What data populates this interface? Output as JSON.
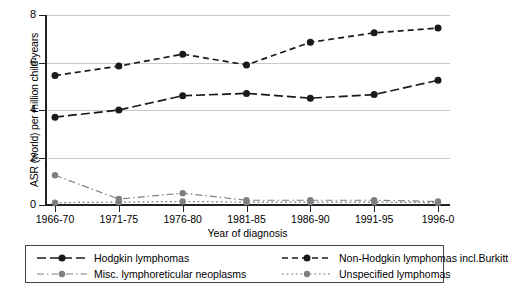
{
  "chart_data": {
    "type": "line",
    "title": "",
    "xlabel": "Year of diagnosis",
    "ylabel": "ASR (world) per million child-years",
    "categories": [
      "1966-70",
      "1971-75",
      "1976-80",
      "1981-85",
      "1986-90",
      "1991-95",
      "1996-0"
    ],
    "ylim": [
      0,
      8
    ],
    "yticks": [
      "0",
      "2",
      "4",
      "6",
      "8"
    ],
    "grid": "horizontal",
    "legend_position": "bottom",
    "series": [
      {
        "name": "Hodgkin lymphomas",
        "values": [
          3.7,
          4.0,
          4.6,
          4.7,
          4.5,
          4.65,
          5.25
        ],
        "color": "#1a1a1a",
        "dash": "long-dash",
        "marker": "circle"
      },
      {
        "name": "Non-Hodgkin lymphomas incl.Burkitt",
        "values": [
          5.45,
          5.85,
          6.35,
          5.9,
          6.85,
          7.25,
          7.45
        ],
        "color": "#1a1a1a",
        "dash": "dash",
        "marker": "circle"
      },
      {
        "name": "Misc. lymphoreticular neoplasms",
        "values": [
          1.25,
          0.25,
          0.5,
          0.2,
          0.2,
          0.2,
          0.15
        ],
        "color": "#808080",
        "dash": "dash-dot",
        "marker": "circle"
      },
      {
        "name": "Unspecified lymphomas",
        "values": [
          0.1,
          0.12,
          0.15,
          0.12,
          0.12,
          0.12,
          0.1
        ],
        "color": "#808080",
        "dash": "dot",
        "marker": "circle"
      }
    ]
  }
}
